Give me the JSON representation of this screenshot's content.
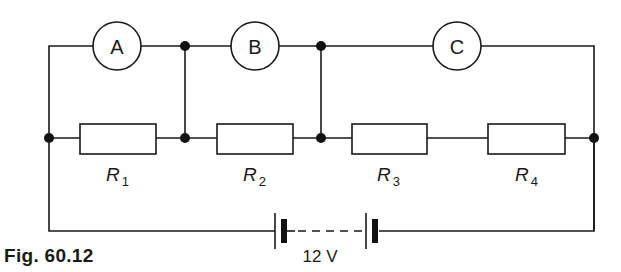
{
  "figure": {
    "caption": "Fig. 60.12"
  },
  "meters": [
    {
      "label": "A"
    },
    {
      "label": "B"
    },
    {
      "label": "C"
    }
  ],
  "resistors": [
    {
      "symbol": "R",
      "subscript": "1"
    },
    {
      "symbol": "R",
      "subscript": "2"
    },
    {
      "symbol": "R",
      "subscript": "3"
    },
    {
      "symbol": "R",
      "subscript": "4"
    }
  ],
  "battery": {
    "voltage_label": "12 V"
  },
  "colors": {
    "line": "#1a1a1a",
    "background": "#ffffff"
  }
}
